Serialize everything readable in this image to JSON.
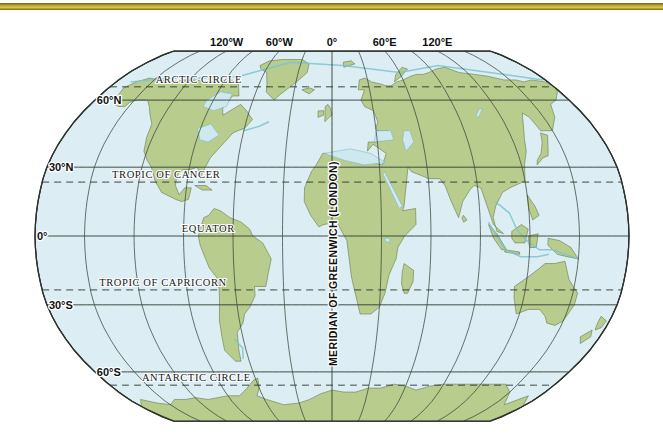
{
  "page": {
    "background_color": "#ffffff"
  },
  "top_rule": {
    "name": "decorative-gold-rule",
    "color": "#c8b434"
  },
  "map": {
    "projection": "robinson",
    "ocean_color": "#dceef3",
    "land_color": "#b7cc8d",
    "coast_color": "#5f7246",
    "shelf_color": "#7fc3cf",
    "graticule_color": "#2f3a33",
    "special_line_style": "dashed",
    "longitude_labels": [
      {
        "id": "lon-120w",
        "text": "120°W",
        "lon": -120
      },
      {
        "id": "lon-60w",
        "text": "60°W",
        "lon": -60
      },
      {
        "id": "lon-0",
        "text": "0°",
        "lon": 0
      },
      {
        "id": "lon-60e",
        "text": "60°E",
        "lon": 60
      },
      {
        "id": "lon-120e",
        "text": "120°E",
        "lon": 120
      }
    ],
    "latitude_labels": [
      {
        "id": "lat-60n",
        "text": "60°N",
        "lat": 60
      },
      {
        "id": "lat-30n",
        "text": "30°N",
        "lat": 30
      },
      {
        "id": "lat-0",
        "text": "0°",
        "lat": 0
      },
      {
        "id": "lat-30s",
        "text": "30°S",
        "lat": -30
      },
      {
        "id": "lat-60s",
        "text": "60°S",
        "lat": -60
      }
    ],
    "named_lines": [
      {
        "id": "arctic-circle",
        "text": "ARCTIC CIRCLE",
        "lat": 66.5,
        "style": "dashed"
      },
      {
        "id": "tropic-of-cancer",
        "text": "TROPIC OF CANCER",
        "lat": 23.5,
        "style": "dashed"
      },
      {
        "id": "equator",
        "text": "EQUATOR",
        "lat": 0,
        "style": "solid"
      },
      {
        "id": "tropic-of-capricorn",
        "text": "TROPIC OF CAPRICORN",
        "lat": -23.5,
        "style": "dashed"
      },
      {
        "id": "antarctic-circle",
        "text": "ANTARCTIC CIRCLE",
        "lat": -66.5,
        "style": "dashed"
      }
    ],
    "prime_meridian": {
      "id": "meridian-greenwich",
      "text": "MERIDIAN OF GREENWICH (LONDON)",
      "lon": 0,
      "orientation": "vertical"
    },
    "graticule": {
      "parallel_step_degrees": 30,
      "meridian_step_degrees": 30,
      "latitude_range": [
        -90,
        90
      ],
      "longitude_range": [
        -180,
        180
      ]
    }
  }
}
